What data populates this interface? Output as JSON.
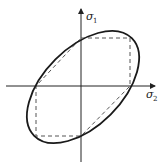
{
  "diagram": {
    "type": "yield-surface-plane-stress",
    "axes": {
      "horizontal": {
        "symbol": "σ",
        "subscript": "2"
      },
      "vertical": {
        "symbol": "σ",
        "subscript": "1"
      }
    },
    "curves": [
      {
        "name": "ellipse",
        "style": "solid"
      },
      {
        "name": "hexagon",
        "style": "dashed"
      }
    ],
    "colors": {
      "stroke": "#1a1a1a",
      "dashed": "#555555",
      "background": "#ffffff"
    }
  }
}
